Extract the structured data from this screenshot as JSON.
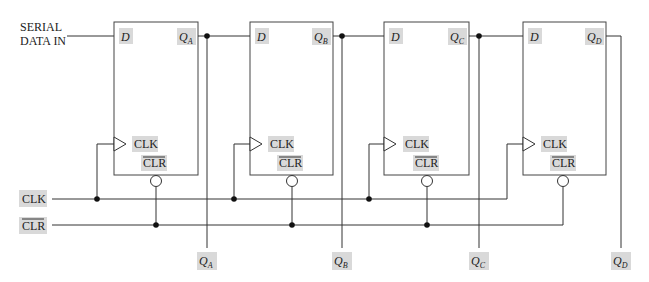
{
  "input": {
    "line1": "SERIAL",
    "line2": "DATA IN"
  },
  "bus": {
    "clk_label": "CLK",
    "clr_label": "CLR"
  },
  "flipflops": [
    {
      "id": "A",
      "d_label": "D",
      "q_label": "Q",
      "q_sub": "A",
      "clk_label": "CLK",
      "clr_label": "CLR"
    },
    {
      "id": "B",
      "d_label": "D",
      "q_label": "Q",
      "q_sub": "B",
      "clk_label": "CLK",
      "clr_label": "CLR"
    },
    {
      "id": "C",
      "d_label": "D",
      "q_label": "Q",
      "q_sub": "C",
      "clk_label": "CLK",
      "clr_label": "CLR"
    },
    {
      "id": "D",
      "d_label": "D",
      "q_label": "Q",
      "q_sub": "D",
      "clk_label": "CLK",
      "clr_label": "CLR"
    }
  ],
  "outputs": [
    {
      "q": "Q",
      "sub": "A"
    },
    {
      "q": "Q",
      "sub": "B"
    },
    {
      "q": "Q",
      "sub": "C"
    },
    {
      "q": "Q",
      "sub": "D"
    }
  ],
  "colors": {
    "wire": "#333333",
    "label_bg": "#d9d9d9",
    "background": "#ffffff"
  }
}
